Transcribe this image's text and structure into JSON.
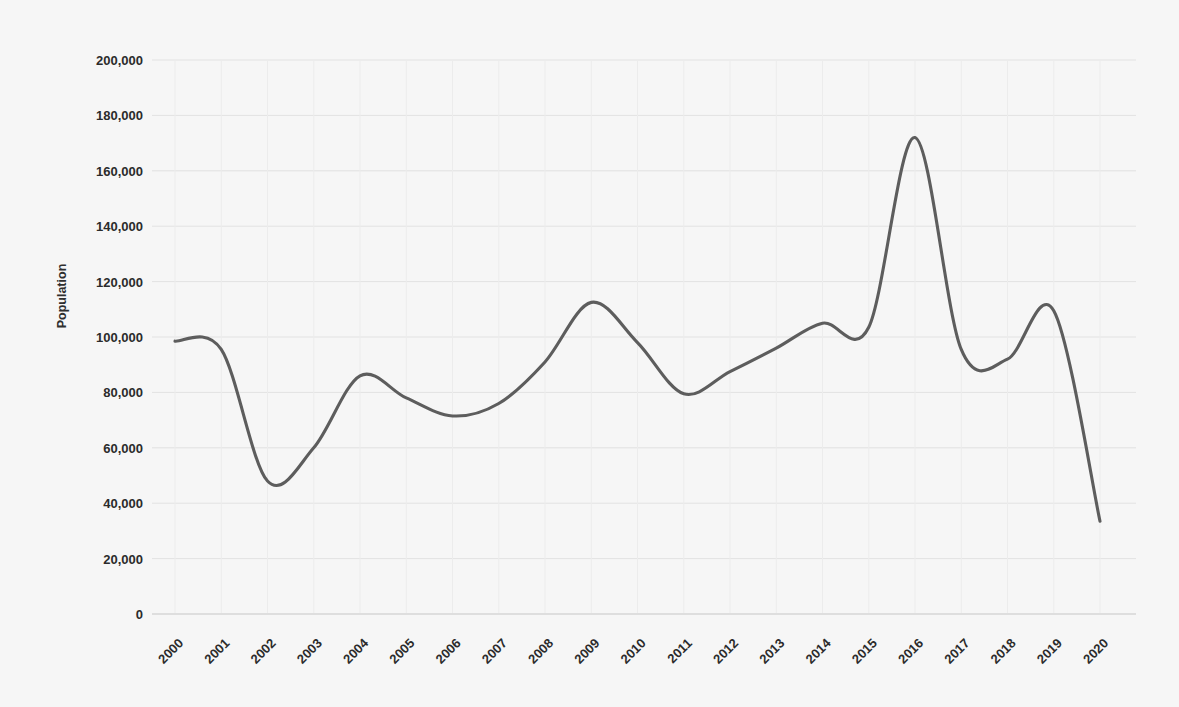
{
  "chart_data": {
    "type": "line",
    "title": "",
    "subtitle": "",
    "xlabel": "",
    "ylabel": "Population",
    "x": [
      2000,
      2001,
      2002,
      2003,
      2004,
      2005,
      2006,
      2007,
      2008,
      2009,
      2010,
      2011,
      2012,
      2013,
      2014,
      2015,
      2016,
      2017,
      2018,
      2019,
      2020
    ],
    "categories": [
      "2000",
      "2001",
      "2002",
      "2003",
      "2004",
      "2005",
      "2006",
      "2007",
      "2008",
      "2009",
      "2010",
      "2011",
      "2012",
      "2013",
      "2014",
      "2015",
      "2016",
      "2017",
      "2018",
      "2019",
      "2020"
    ],
    "values": [
      98500,
      95500,
      48000,
      60000,
      86000,
      78000,
      71500,
      76000,
      91000,
      112500,
      98000,
      79500,
      87500,
      96000,
      105000,
      103500,
      172000,
      95500,
      92000,
      109500,
      33500
    ],
    "series": [
      {
        "name": "Population",
        "values": [
          98500,
          95500,
          48000,
          60000,
          86000,
          78000,
          71500,
          76000,
          91000,
          112500,
          98000,
          79500,
          87500,
          96000,
          105000,
          103500,
          172000,
          95500,
          92000,
          109500,
          33500
        ]
      }
    ],
    "ylim": [
      0,
      200000
    ],
    "xlim": [
      2000,
      2020
    ],
    "yticks": [
      0,
      20000,
      40000,
      60000,
      80000,
      100000,
      120000,
      140000,
      160000,
      180000,
      200000
    ],
    "ytick_labels": [
      "0",
      "20,000",
      "40,000",
      "60,000",
      "80,000",
      "100,000",
      "120,000",
      "140,000",
      "160,000",
      "180,000",
      "200,000"
    ],
    "xtick_labels": [
      "2000",
      "2001",
      "2002",
      "2003",
      "2004",
      "2005",
      "2006",
      "2007",
      "2008",
      "2009",
      "2010",
      "2011",
      "2012",
      "2013",
      "2014",
      "2015",
      "2016",
      "2017",
      "2018",
      "2019",
      "2020"
    ],
    "xtick_rotation_deg": -45,
    "grid": {
      "horizontal": true,
      "vertical": true
    },
    "legend": {
      "visible": false,
      "position": "none"
    },
    "smoothing": "spline",
    "colors": {
      "line": "#5d5d5d",
      "background": "#f6f6f6",
      "grid_horizontal": "#e2e2e2",
      "grid_vertical": "#ececec",
      "axis": "#cfcfcf",
      "text": "#2b2b2b"
    },
    "markers": {
      "visible": false
    }
  }
}
